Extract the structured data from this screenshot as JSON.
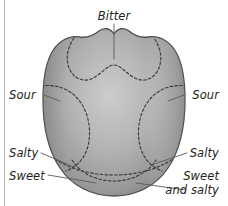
{
  "figure": {
    "background_color": "#ffffff",
    "frame_line_color": "#b9b9b9"
  },
  "tongue": {
    "fill_light": "#c8c8c8",
    "fill_mid": "#a6a6a6",
    "fill_dark": "#7d7d7d",
    "outline_color": "#4a4a4a",
    "zone_line_color": "#3a3a3a",
    "zone_line_style": "dashed"
  },
  "labels": [
    {
      "id": "bitter",
      "text": "Bitter",
      "align": "center"
    },
    {
      "id": "sour-left",
      "text": "Sour",
      "align": "start"
    },
    {
      "id": "sour-right",
      "text": "Sour",
      "align": "end"
    },
    {
      "id": "salty-left",
      "text": "Salty",
      "align": "start"
    },
    {
      "id": "salty-right",
      "text": "Salty",
      "align": "end"
    },
    {
      "id": "sweet-left",
      "text": "Sweet",
      "align": "start"
    },
    {
      "id": "sweet-right",
      "text": "Sweet",
      "align": "end"
    },
    {
      "id": "and-salty-right",
      "text": "and salty",
      "align": "end"
    }
  ]
}
